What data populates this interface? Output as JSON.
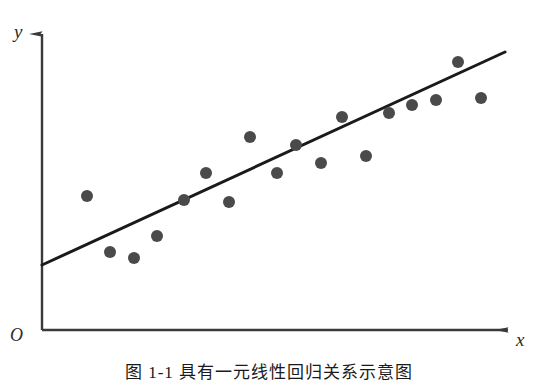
{
  "figure": {
    "caption": "图 1-1  具有一元线性回归关系示意图",
    "background_color": "#ffffff"
  },
  "axes": {
    "y_label": "y",
    "x_label": "x",
    "origin_label": "O",
    "axis_color": "#3a3a3a",
    "arrow_style": "solid-head"
  },
  "chart_data": {
    "type": "scatter",
    "title": "",
    "xlabel": "x",
    "ylabel": "y",
    "grid": false,
    "legend": false,
    "xlim": [
      0,
      100
    ],
    "ylim": [
      0,
      100
    ],
    "point_color": "#4a4a4a",
    "point_radius_px": 6,
    "series": [
      {
        "name": "observations",
        "points": [
          {
            "px": 87,
            "py": 196,
            "x": 9.7,
            "y": 26.9
          },
          {
            "px": 110,
            "py": 252,
            "x": 14.7,
            "y": 6.2
          },
          {
            "px": 134,
            "py": 258,
            "x": 19.9,
            "y": 4.1
          },
          {
            "px": 157,
            "py": 236,
            "x": 24.9,
            "y": 12.2
          },
          {
            "px": 184,
            "py": 200,
            "x": 30.8,
            "y": 25.5
          },
          {
            "px": 206,
            "py": 173,
            "x": 35.6,
            "y": 35.4
          },
          {
            "px": 229,
            "py": 202,
            "x": 40.6,
            "y": 24.7
          },
          {
            "px": 250,
            "py": 137,
            "x": 45.1,
            "y": 48.7
          },
          {
            "px": 277,
            "py": 173,
            "x": 51.0,
            "y": 35.4
          },
          {
            "px": 296,
            "py": 145,
            "x": 55.1,
            "y": 45.8
          },
          {
            "px": 321,
            "py": 163,
            "x": 60.6,
            "y": 39.1
          },
          {
            "px": 342,
            "py": 117,
            "x": 65.1,
            "y": 56.1
          },
          {
            "px": 366,
            "py": 156,
            "x": 70.3,
            "y": 41.7
          },
          {
            "px": 389,
            "py": 113,
            "x": 75.3,
            "y": 57.6
          },
          {
            "px": 412,
            "py": 105,
            "x": 80.3,
            "y": 60.5
          },
          {
            "px": 436,
            "py": 100,
            "x": 85.5,
            "y": 62.4
          },
          {
            "px": 458,
            "py": 62,
            "x": 90.3,
            "y": 76.4
          },
          {
            "px": 481,
            "py": 98,
            "x": 95.3,
            "y": 63.1
          }
        ]
      }
    ],
    "fit_line": {
      "name": "regression-line",
      "color": "#1a1a1a",
      "width_px": 3,
      "p1": {
        "px": 42,
        "py": 265
      },
      "p2": {
        "px": 505,
        "py": 52
      },
      "slope_px": -0.46,
      "description": "least squares regression line"
    }
  }
}
